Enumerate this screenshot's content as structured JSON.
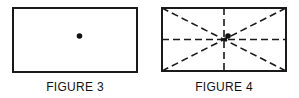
{
  "figures": [
    {
      "id": "figure-3",
      "caption": "FIGURE 3",
      "description": "Rectangle with a single dot near its center"
    },
    {
      "id": "figure-4",
      "caption": "FIGURE 4",
      "description": "Rectangle with dashed diagonals and dashed center lines crossing at the center, dot slightly offset from the intersection"
    }
  ],
  "colors": {
    "stroke": "#1a1a1a",
    "background": "#ffffff"
  }
}
